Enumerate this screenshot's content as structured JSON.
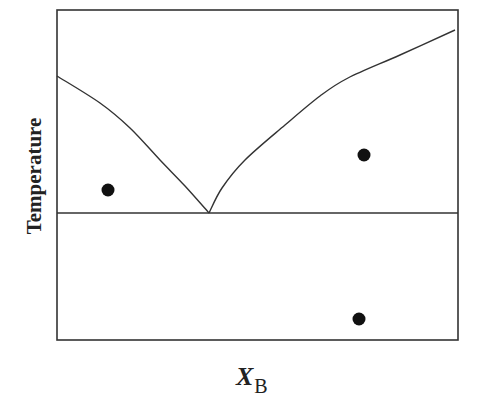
{
  "chart_data": {
    "type": "phase-diagram",
    "title": "",
    "xlabel": "X_B",
    "xlabel_main": "X",
    "xlabel_sub": "B",
    "ylabel": "Temperature",
    "grid": false,
    "frame": {
      "left": 57,
      "top": 10,
      "right": 458,
      "bottom": 340
    },
    "eutectic_point": {
      "x": 209,
      "y": 213
    },
    "eutectic_line_y": 213,
    "liquidus_left": [
      [
        57,
        76
      ],
      [
        100,
        103
      ],
      [
        130,
        128
      ],
      [
        160,
        160
      ],
      [
        185,
        186
      ],
      [
        209,
        213
      ]
    ],
    "liquidus_right": [
      [
        209,
        213
      ],
      [
        222,
        188
      ],
      [
        245,
        160
      ],
      [
        285,
        125
      ],
      [
        320,
        96
      ],
      [
        348,
        78
      ],
      [
        400,
        55
      ],
      [
        455,
        30
      ]
    ],
    "points": [
      {
        "x": 108,
        "y": 190
      },
      {
        "x": 364,
        "y": 155
      },
      {
        "x": 359,
        "y": 319
      }
    ]
  }
}
